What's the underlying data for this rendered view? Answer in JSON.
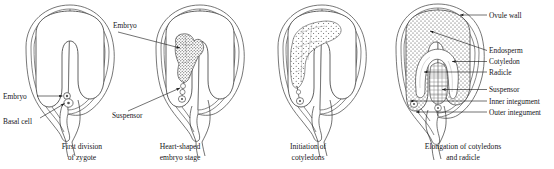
{
  "figure": {
    "ink_color": "#1b1b1b",
    "background_color": "#ffffff"
  },
  "panels": [
    {
      "id": "panel-1",
      "caption_line1": "First division",
      "caption_line2": "of zygote",
      "labels": [
        {
          "text": "Embryo",
          "side": "left"
        },
        {
          "text": "Basal cell",
          "side": "left"
        }
      ]
    },
    {
      "id": "panel-2",
      "caption_line1": "Heart-shaped",
      "caption_line2": "embryo stage",
      "labels": [
        {
          "text": "Embryo",
          "side": "left"
        },
        {
          "text": "Suspensor",
          "side": "left"
        }
      ]
    },
    {
      "id": "panel-3",
      "caption_line1": "Initiation of",
      "caption_line2": "cotyledons",
      "labels": []
    },
    {
      "id": "panel-4",
      "caption_line1": "Elongation of cotyledons",
      "caption_line2": "and radicle",
      "labels": [
        {
          "text": "Ovule wall",
          "side": "right"
        },
        {
          "text": "Endosperm",
          "side": "right"
        },
        {
          "text": "Cotyledon",
          "side": "right"
        },
        {
          "text": "Radicle",
          "side": "right"
        },
        {
          "text": "Suspensor",
          "side": "right"
        },
        {
          "text": "Inner integument",
          "side": "right"
        },
        {
          "text": "Outer integument",
          "side": "right"
        }
      ]
    }
  ]
}
